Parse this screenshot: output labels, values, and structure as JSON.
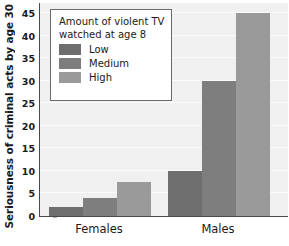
{
  "chart_data": {
    "type": "bar",
    "title": "",
    "xlabel": "",
    "ylabel": "Seriousness of criminal acts by age 30",
    "categories": [
      "Females",
      "Males"
    ],
    "series": [
      {
        "name": "Low",
        "values": [
          2,
          10
        ],
        "color": "#6e6e6e"
      },
      {
        "name": "Medium",
        "values": [
          4,
          30
        ],
        "color": "#7e7e7e"
      },
      {
        "name": "High",
        "values": [
          7.5,
          45
        ],
        "color": "#9a9a9a"
      }
    ],
    "ylim": [
      0,
      47.5
    ],
    "yticks": [
      0,
      5,
      10,
      15,
      20,
      25,
      30,
      35,
      40,
      45
    ],
    "ytick_labels": [
      "0",
      "5",
      "10",
      "15",
      "20",
      "25",
      "30",
      "35",
      "40",
      "45"
    ],
    "grid": true,
    "legend_position": "upper-left",
    "legend_title": "Amount of violent TV watched at age 8",
    "plot_background": "#f0f0f0",
    "axis_color": "#4a4a4a"
  },
  "legend": {
    "title": "Amount of violent TV watched at age 8",
    "entries": [
      {
        "label": "Low"
      },
      {
        "label": "Medium"
      },
      {
        "label": "High"
      }
    ]
  },
  "axes": {
    "y_title": "Seriousness of criminal acts by age 30",
    "x_categories": [
      "Females",
      "Males"
    ]
  }
}
